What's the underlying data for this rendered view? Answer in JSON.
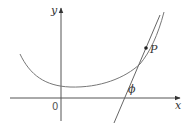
{
  "diagram": {
    "type": "tangent-line-angle",
    "labels": {
      "y_axis": "y",
      "x_axis": "x",
      "origin": "0",
      "point": "P",
      "angle": "ϕ"
    },
    "colors": {
      "axis": "#555555",
      "curve": "#777777",
      "tangent": "#666666",
      "text": "#333333",
      "background": "#ffffff"
    },
    "elements": [
      {
        "name": "x-axis",
        "description": "horizontal axis with arrow pointing right"
      },
      {
        "name": "y-axis",
        "description": "vertical axis with arrow pointing up"
      },
      {
        "name": "curve",
        "description": "concave-up curve with minimum near the y-axis, rising steeply to the right"
      },
      {
        "name": "tangent-line",
        "description": "line tangent to the curve at point P, crossing the x-axis"
      },
      {
        "name": "point-P",
        "description": "point of tangency on the curve"
      },
      {
        "name": "angle-phi",
        "description": "angle between tangent line and positive x-axis"
      }
    ]
  }
}
